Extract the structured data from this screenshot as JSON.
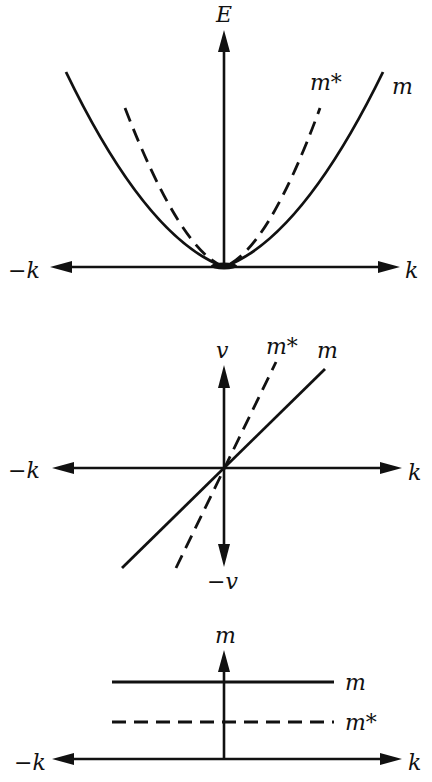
{
  "panels": [
    {
      "id": "energy-dispersion",
      "y_axis_label": "E",
      "x_axis_pos_label": "k",
      "x_axis_neg_label": "−k",
      "curves": [
        {
          "name": "m",
          "style": "solid",
          "shape": "parabola"
        },
        {
          "name": "m*",
          "style": "dashed",
          "shape": "parabola (narrower)"
        }
      ],
      "labels": {
        "m": "m",
        "m_star": "m*"
      }
    },
    {
      "id": "velocity",
      "y_axis_label": "v",
      "y_axis_neg_label": "−v",
      "x_axis_pos_label": "k",
      "x_axis_neg_label": "−k",
      "curves": [
        {
          "name": "m",
          "style": "solid",
          "shape": "line"
        },
        {
          "name": "m*",
          "style": "dashed",
          "shape": "line (steeper)"
        }
      ],
      "labels": {
        "m": "m",
        "m_star": "m*"
      }
    },
    {
      "id": "mass",
      "y_axis_label": "m",
      "x_axis_pos_label": "k",
      "x_axis_neg_label": "−k",
      "curves": [
        {
          "name": "m",
          "style": "solid",
          "shape": "horizontal line"
        },
        {
          "name": "m*",
          "style": "dashed",
          "shape": "horizontal line (lower)"
        }
      ],
      "labels": {
        "m": "m",
        "m_star": "m*"
      }
    }
  ]
}
